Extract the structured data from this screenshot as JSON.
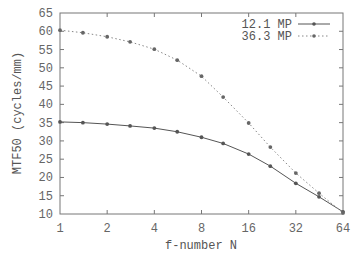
{
  "chart_data": {
    "type": "line",
    "title": "",
    "xlabel": "f-number N",
    "ylabel": "MTF50 (cycles/mm)",
    "x_scale": "log2",
    "xlim": [
      1,
      64
    ],
    "ylim": [
      10,
      65
    ],
    "x_ticks": [
      1,
      2,
      4,
      8,
      16,
      32,
      64
    ],
    "x_tick_labels": [
      "1",
      "2",
      "4",
      "8",
      "16",
      "32",
      "64"
    ],
    "y_ticks": [
      10,
      15,
      20,
      25,
      30,
      35,
      40,
      45,
      50,
      55,
      60,
      65
    ],
    "y_tick_labels": [
      "10",
      "15",
      "20",
      "25",
      "30",
      "35",
      "40",
      "45",
      "50",
      "55",
      "60",
      "65"
    ],
    "grid": false,
    "legend_position": "top-right",
    "x": [
      1,
      1.4,
      2,
      2.8,
      4,
      5.6,
      8,
      11,
      16,
      22,
      32,
      45,
      64
    ],
    "series": [
      {
        "name": "12.1 MP",
        "style": "solid",
        "color": "#555555",
        "values": [
          35.2,
          35.0,
          34.6,
          34.1,
          33.5,
          32.5,
          31.0,
          29.3,
          26.4,
          23.1,
          18.4,
          14.7,
          10.6
        ]
      },
      {
        "name": "36.3 MP",
        "style": "dotted",
        "color": "#777777",
        "values": [
          60.3,
          59.6,
          58.5,
          57.1,
          55.1,
          52.1,
          47.7,
          42.0,
          34.9,
          28.3,
          21.2,
          15.7,
          10.3
        ]
      }
    ]
  }
}
